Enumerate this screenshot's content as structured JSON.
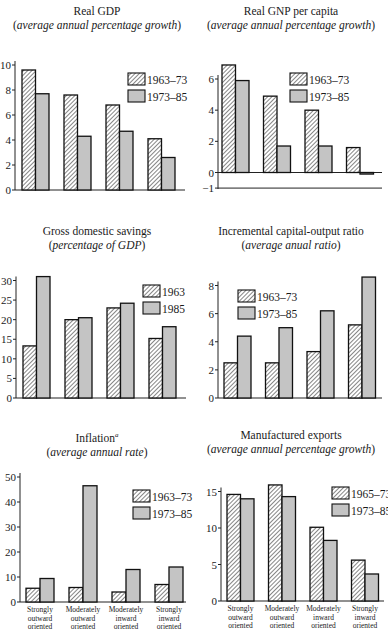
{
  "colors": {
    "hatch_fill": "#ffffff",
    "hatch_stroke": "#444444",
    "solid_fill": "#c4c4c4",
    "bar_outline": "#111111",
    "axis": "#222222"
  },
  "chart_data": [
    {
      "id": "real-gdp",
      "type": "bar",
      "title": "Real GDP",
      "subtitle": "average annual percentage growth",
      "categories": [
        "Strongly outward oriented",
        "Moderately outward oriented",
        "Moderately inward oriented",
        "Strongly inward oriented"
      ],
      "series": [
        {
          "name": "1963–73",
          "pattern": "hatched",
          "values": [
            9.6,
            7.6,
            6.8,
            4.1
          ]
        },
        {
          "name": "1973–85",
          "pattern": "solid",
          "values": [
            7.7,
            4.3,
            4.7,
            2.6
          ]
        }
      ],
      "yticks": [
        0,
        2,
        4,
        6,
        8,
        10
      ],
      "ylim": [
        0,
        10
      ],
      "show_category_labels": false,
      "legend_position": "upper right"
    },
    {
      "id": "real-gnp-per-capita",
      "type": "bar",
      "title": "Real GNP per capita",
      "subtitle": "average annual percentage growth",
      "categories": [
        "Strongly outward oriented",
        "Moderately outward oriented",
        "Moderately inward oriented",
        "Strongly inward oriented"
      ],
      "series": [
        {
          "name": "1963–73",
          "pattern": "hatched",
          "values": [
            6.9,
            4.9,
            4.0,
            1.6
          ]
        },
        {
          "name": "1973–85",
          "pattern": "solid",
          "values": [
            5.9,
            1.7,
            1.7,
            -0.1
          ]
        }
      ],
      "yticks": [
        -1,
        0,
        2,
        4,
        6
      ],
      "ylim": [
        -1,
        7
      ],
      "show_category_labels": false,
      "legend_position": "upper right"
    },
    {
      "id": "gross-domestic-savings",
      "type": "bar",
      "title": "Gross domestic savings",
      "subtitle": "percentage of GDP",
      "categories": [
        "Strongly outward oriented",
        "Moderately outward oriented",
        "Moderately inward oriented",
        "Strongly inward oriented"
      ],
      "series": [
        {
          "name": "1963",
          "pattern": "hatched",
          "values": [
            13.3,
            20.0,
            23.0,
            15.2
          ]
        },
        {
          "name": "1985",
          "pattern": "solid",
          "values": [
            31.0,
            20.5,
            24.2,
            18.2
          ]
        }
      ],
      "yticks": [
        0,
        5,
        10,
        15,
        20,
        25,
        30
      ],
      "ylim": [
        0,
        32
      ],
      "show_category_labels": false,
      "legend_position": "upper right"
    },
    {
      "id": "incremental-capital-output-ratio",
      "type": "bar",
      "title": "Incremental capital-output ratio",
      "subtitle": "average anual ratio",
      "categories": [
        "Strongly outward oriented",
        "Moderately outward oriented",
        "Moderately inward oriented",
        "Strongly inward oriented"
      ],
      "series": [
        {
          "name": "1963–73",
          "pattern": "hatched",
          "values": [
            2.5,
            2.5,
            3.3,
            5.2
          ]
        },
        {
          "name": "1973–85",
          "pattern": "solid",
          "values": [
            4.4,
            5.0,
            6.2,
            8.6
          ]
        }
      ],
      "yticks": [
        0,
        2,
        4,
        6,
        8
      ],
      "ylim": [
        0,
        9
      ],
      "show_category_labels": false,
      "legend_position": "upper left"
    },
    {
      "id": "inflation",
      "type": "bar",
      "title": "Inflation",
      "title_superscript": "a",
      "subtitle": "average annual rate",
      "categories": [
        "Strongly outward oriented",
        "Moderately outward oriented",
        "Moderately inward oriented",
        "Strongly inward oriented"
      ],
      "category_lines": [
        [
          "Strongly",
          "outward",
          "oriented"
        ],
        [
          "Moderately",
          "outward",
          "oriented"
        ],
        [
          "Moderately",
          "inward",
          "oriented"
        ],
        [
          "Strongly",
          "inward",
          "oriented"
        ]
      ],
      "series": [
        {
          "name": "1963–73",
          "pattern": "hatched",
          "values": [
            5.5,
            5.8,
            4.0,
            7.0
          ]
        },
        {
          "name": "1973–85",
          "pattern": "solid",
          "values": [
            9.4,
            46.5,
            13.0,
            14.0
          ]
        }
      ],
      "yticks": [
        0,
        10,
        20,
        30,
        40,
        50
      ],
      "ylim": [
        0,
        50
      ],
      "show_category_labels": true,
      "legend_position": "upper right"
    },
    {
      "id": "manufactured-exports",
      "type": "bar",
      "title": "Manufactured exports",
      "subtitle": "average annual percentage growth",
      "categories": [
        "Strongly outward oriented",
        "Moderately outward oriented",
        "Moderately inward oriented",
        "Strongly inward oriented"
      ],
      "category_lines": [
        [
          "Strongly",
          "outward",
          "oriented"
        ],
        [
          "Moderately",
          "outward",
          "oriented"
        ],
        [
          "Moderately",
          "inward",
          "oriented"
        ],
        [
          "Strongly",
          "inward",
          "oriented"
        ]
      ],
      "series": [
        {
          "name": "1965–73",
          "pattern": "hatched",
          "values": [
            14.6,
            15.9,
            10.1,
            5.6
          ]
        },
        {
          "name": "1973–85",
          "pattern": "solid",
          "values": [
            14.0,
            14.3,
            8.3,
            3.7
          ]
        }
      ],
      "yticks": [
        0,
        5,
        10,
        15
      ],
      "ylim": [
        0,
        16.5
      ],
      "show_category_labels": true,
      "legend_position": "upper right"
    }
  ]
}
